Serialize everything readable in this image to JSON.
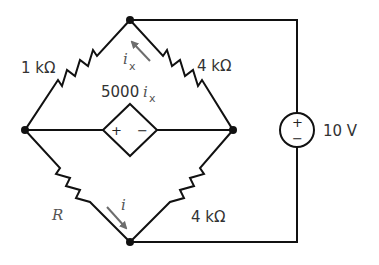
{
  "diagram": {
    "type": "circuit",
    "components": {
      "r_top_left": {
        "label": "1 kΩ"
      },
      "r_top_right": {
        "label": "4 kΩ"
      },
      "r_bottom_left": {
        "label": "R"
      },
      "r_bottom_right": {
        "label": "4 kΩ"
      },
      "dependent_source": {
        "label_coeff": "5000",
        "label_var": "i",
        "label_sub": "x",
        "plus": "+",
        "minus": "−"
      },
      "voltage_source": {
        "label": "10 V",
        "plus": "+",
        "minus": "−"
      }
    },
    "currents": {
      "ix": {
        "var": "i",
        "sub": "x"
      },
      "i": {
        "var": "i"
      }
    },
    "colors": {
      "wire": "#111111",
      "arrow": "#6d6d6d",
      "text": "#333333"
    }
  }
}
